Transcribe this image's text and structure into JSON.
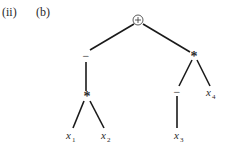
{
  "labels": {
    "part": "(ii)",
    "subpart": "(b)"
  },
  "tree": {
    "root": {
      "symbol": "+",
      "circled": true
    },
    "left_neg": {
      "symbol": "−"
    },
    "left_mul": {
      "symbol": "*"
    },
    "right_mul": {
      "symbol": "*"
    },
    "right_neg": {
      "symbol": "−"
    },
    "leaves": {
      "x1": {
        "base": "x",
        "sub": "1"
      },
      "x2": {
        "base": "x",
        "sub": "2"
      },
      "x3": {
        "base": "x",
        "sub": "3"
      },
      "x4": {
        "base": "x",
        "sub": "4"
      }
    }
  },
  "colors": {
    "line": "#1a1a1a",
    "text": "#2a2a2a"
  }
}
